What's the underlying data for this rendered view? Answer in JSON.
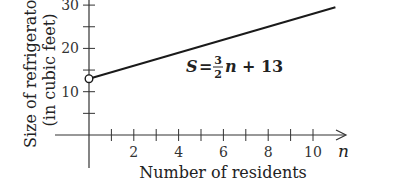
{
  "chart_data": {
    "type": "line",
    "title": "",
    "xlabel": "Number of residents",
    "ylabel_line1": "Size of refrigerator",
    "ylabel_line2": "(in cubic feet)",
    "x_var": "n",
    "xlim": [
      0,
      11
    ],
    "ylim": [
      0,
      30
    ],
    "x_ticks": [
      1,
      2,
      3,
      4,
      5,
      6,
      7,
      8,
      9,
      10
    ],
    "x_tick_labels": [
      {
        "value": 2,
        "label": "2"
      },
      {
        "value": 4,
        "label": "4"
      },
      {
        "value": 6,
        "label": "6"
      },
      {
        "value": 8,
        "label": "8"
      },
      {
        "value": 10,
        "label": "10"
      }
    ],
    "y_ticks": [
      5,
      10,
      15,
      20,
      25,
      30
    ],
    "y_tick_labels": [
      {
        "value": 10,
        "label": "10"
      },
      {
        "value": 20,
        "label": "20"
      },
      {
        "value": 30,
        "label": "30"
      }
    ],
    "series": [
      {
        "name": "S = 3/2 n + 13",
        "slope": 1.5,
        "intercept": 13,
        "x": [
          0,
          11
        ],
        "y": [
          13,
          29.5
        ],
        "open_start": true
      }
    ],
    "annotation": {
      "lhs": "S",
      "eq": "=",
      "num": "3",
      "den": "2",
      "var": "n",
      "rest": "+ 13"
    },
    "grid": false
  }
}
